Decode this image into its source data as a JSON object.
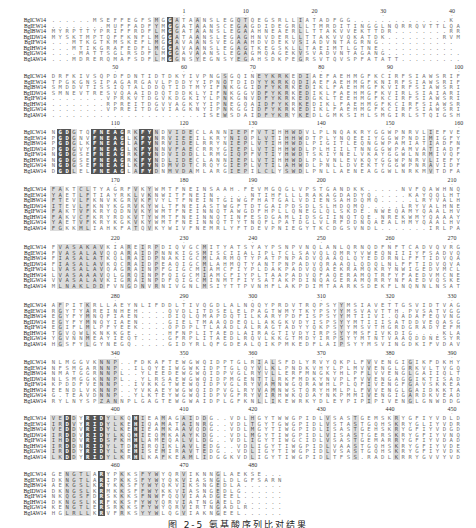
{
  "figure": {
    "caption": "图 2-5 氨基酸序列比对结果",
    "colors": {
      "conserved_bg": "#555555",
      "conserved_fg": "#ffffff",
      "similar_bg": "#dcdcdc",
      "default_fg": "#777777"
    },
    "sequence_names": [
      "BgICW14",
      "BgIEW14",
      "BgIBW14",
      "BgIDW14",
      "BgIFW14",
      "BgIHW14",
      "BgIGW14",
      "BgIAW14"
    ],
    "blocks": [
      {
        "top": 8,
        "ruler": [
          {
            "label": "1",
            "col": 19
          },
          {
            "label": "10",
            "col": 28
          },
          {
            "label": "20",
            "col": 38
          },
          {
            "label": "30",
            "col": 48
          },
          {
            "label": "40",
            "col": 58
          }
        ],
        "rows": [
          "......MSEFFEGFSMGGATAANSLEGQTQEGSRLLIATADFGG..............K",
          "........MUFFADFYMGGATAANSCEGAGDIDEGRLLTMRDITINGGLNQRRQVTTLQADG",
          "MYRPTTYPRIFFRDFLMGGATAANSLEGAAHNEAERLLTTAKVVEKTTDR........RRM",
          "MYSKTMPTQFFKNFLMGGATAANSLEGAGHNVDERLLTTAKVVQKATDK........RVM",
          "...MTKGTKMSKEFLMGGAVAANSVEGAAHDVDEKVSIADVNTAGRNG...........",
          "...MTIKGRAFEDFLMGGAVAANSLEGAGTKEGSKLLTAEIMTLGTNE...........",
          "....MATTSGLRSDFLMGGAVAANSLEGAGMQAGEKVSVADVNTAGANG...........",
          "...MDRERQMAFSDFLMGGNSYEGNSYEGAHSDKPEGRSVTQVSPFATATT........."
        ]
      },
      {
        "top": 64,
        "ruler": [
          {
            "label": "50",
            "col": 9
          },
          {
            "label": "60",
            "col": 19
          },
          {
            "label": "70",
            "col": 29
          },
          {
            "label": "80",
            "col": 39
          },
          {
            "label": "90",
            "col": 49
          },
          {
            "label": "100",
            "col": 59
          }
        ],
        "rows": [
          "DRFKIVSQPDFDNTIDTDKYIVPNGSGQINEYKRKEDIAEFAEHMGFKCIRFSIAWSRIF",
          "TPGKGNSIPAGARGAVLPDDYYIPNQTDIDYYKRKQDIAEFAEHMGFKNIRFSIAWSRIF",
          "SMDDVTISSIQTALDDQTIDTMYIFNKGGIDFYKRKEDIKLFAEHMGFKVIRFSIAWSRIF",
          "SMNEVTRESVQAAIDDQTDDKLYIFNKGGVDFYKRKEDIKLFAEHMGFKVIRLSIAIARIF",
          "........VPRKVTDGVKDGKIYLPNKGNVDFYKRKEDGKLTEEHMGFKCIRFSIAWSRIF",
          "........RPREITDGVVAGKYYIPNEGQAIDFYKRKEDIKLFAEHMGFKCIRFSIAWSRIF",
          "........VPREITDGVIAGKNYIPNKGGIDFYKRKEDIKLFAEHMGFKCIRFSIAWSRIF",
          "......................ISEWSDAIDFYKRYKEDLGMKSIHLSMGIRLSTQIGSHVY"
        ]
      },
      {
        "top": 120,
        "ruler": [
          {
            "label": "110",
            "col": 9
          },
          {
            "label": "120",
            "col": 19
          },
          {
            "label": "130",
            "col": 29
          },
          {
            "label": "140",
            "col": 39
          },
          {
            "label": "150",
            "col": 49
          },
          {
            "label": "160",
            "col": 59
          }
        ],
        "rows": [
          "NGDGTQFNEAGRKFYNDVIDECLANNIEPFVTIHHWDVLPLNQAKRYGGWPNRVLIEFVE",
          "PGDGNVFNEAGLKFYNRVIEEILKRYNIQPLVTIHHWDTPLYNQEEIYGGWPNDIMIGFYQ",
          "PGDGLKFNEAGLAFYNRVIDELRRYNIEPLVTIHHWDLPIGITLEQNGWPAMIATIADFNE",
          "PGDGVYFNEAGLKFYNNVFAECRRYGIEPLVTIHHWDLPLHIILTNNGGWPAMVATIADFTE",
          "NGDGSEFNEAGRKFYNDVIDDLLRMGIQPFVTIYHWDTSKIYNELVKAYGGWLNRMIVQFVE",
          "NGDGSEFNEAGRKFYNDLIDECLANNIEPLVTIHHWDLPLVNLEVKQYGGWPNRVLIEFYN",
          "NGDGSEFNEAGLKFYNDMVDTCRQYGIEPLVTILAHWDLPNLLDVEKTYGGWPNRAVIDFVR",
          "DGDLELFNEAGLAFYDNMVDAMLARGIEPILCLYSWDLPNLLAENEAGGWLNRKMVTDFAEVS"
        ]
      },
      {
        "top": 177,
        "ruler": [
          {
            "label": "170",
            "col": 9
          },
          {
            "label": "180",
            "col": 19
          },
          {
            "label": "190",
            "col": 29
          },
          {
            "label": "200",
            "col": 39
          },
          {
            "label": "210",
            "col": 58
          }
        ],
        "rows": [
          "FAKTCLTYAGRFVKYWMTFNEINSAAH.FEVMGQGLVPSTGANDKK.....NVFQAWHNQ",
          "YAETLFTIAYRKLVKNWITFNEIN.....NTIHFLLLRAKAGDADYQ.....KAYQQLHTQ",
          "FTEVLFKNVKGRVKFVYLTFNEINTGIWGFHATGALVDIENSAHDQMQ.....LRYVALHNQ",
          "ITEVLFKNYKGRVKYWLTFNEIASTWGFTDTGAIPDSDLSLHDQMQ.....LRYVALHNE",
          "FAKTVFKRYQDNVKYWMTFNEINNQTAWGDFHPLLQNEGLQLSKDE.NWEQAMYQAALHVE",
          "FAKVCFKRYRDKVTYWMTFNEINNQTINFESDGAMLIDSGIINQTQE.NREKWMYQAAAYVE",
          "YAETVFKRYKGKVKYWMTFNEINNQTTYTNQFLPATDGLVLRFDDNQAEALHMYQAALHVE",
          "FGKKMLIAHKFATQVKYWIVFNEMRLYFTDEVPNIEGYTKCDGSVNDL.......IRLPANT"
        ]
      },
      {
        "top": 235,
        "ruler": [
          {
            "label": "220",
            "col": 9
          },
          {
            "label": "230",
            "col": 19
          },
          {
            "label": "240",
            "col": 29
          },
          {
            "label": "250",
            "col": 39
          },
          {
            "label": "260",
            "col": 49
          },
          {
            "label": "270",
            "col": 58
          }
        ],
        "rows": [
          "FVASAKAVKIAREIRPDIQVGCMITYATSYAYPSNPVNQLANLQRNQDFNFTCADVQVRG",
          "FVASALAVQQARAIDPNNKIGSMISCIIALIPLTCLSAVQLQMRYVWEQNIIIYFSADVQVRG",
          "FIASALATKQLRAIDPNAKIGCMLARMQTYPATPNPADVQAAQLQYEDDRNLFFTIDVQAR",
          "FIASALAVKQCRAIDPEAQIGCMLAHMQTYANTPNPADVQRAAQLQDQLNLFFTIDVQVAR",
          "LVASALAVQAGRAINPFGIGCMIAMCFIYPLDAKPADVQQAEKRAMQKRYNWIGEDVMCLE",
          "LVASAAAVQLGRQINPFQIGCMIAMCFIYPLTAAPADVQFAQERAMQTRFYFAEDVMCNE",
          "VVASALAVKIGRAINPDFQIGCMINMTFIYSATAKPDINQAGERAMQRRYNFAEDVQSKE",
          "MLNAKLDDFVNGDNVRNIVGNLMSIYTTPVNHFLAKPDIMTAARKSDEKFLNQNNLNSATYVE"
        ]
      },
      {
        "top": 293,
        "ruler": [
          {
            "label": "280",
            "col": 9
          },
          {
            "label": "290",
            "col": 19
          },
          {
            "label": "300",
            "col": 29
          },
          {
            "label": "310",
            "col": 39
          },
          {
            "label": "320",
            "col": 49
          },
          {
            "label": "330",
            "col": 58
          }
        ],
        "rows": [
          "AFPITKRLLAEYNLIFDDLTIVQGDLALNQQYPRDVTRQPSYYMSIAVETTGSVIDTVAG",
          "RGYTYAREINHEH....QVDLITDSELELPAGTWMYTKYPSYYMSVAVTTH.PVSATVGG",
          "EGYFYMNQFIAEN....DIQLQMAPDQTILKARYPDFISPSYYMTIIVI.QADAFEQVNG",
          "EGYFYMNQYIAEN....GIELTMAAQDEQLLAKGKVDYISPSYYMTIIISATDDVEQASG",
          "EGIFLMLPFYEEK....OPDPLTLAADLALRAGTADYYQKPSYYMSVTHGRDGRADYEFM",
          "TGVQWLKNKKGE.....HFNPLITAEDLAIRAGTIVDYIRPSYYMSFIVKDIG....KLAYN",
          "YGVNNMEAYIEQT....GFRPLITAEDLRQVLKKGTMDYIRPSYYMTNTVAAQDDNESYRFV",
          "HGSFYLGYNEGQ.....GIDYRLQFGDEALQIKPMKEDFLAIPSYYMSVINGDKIFVDAVFN"
        ]
      },
      {
        "top": 350,
        "ruler": [
          {
            "label": "340",
            "col": 9
          },
          {
            "label": "350",
            "col": 19
          },
          {
            "label": "360",
            "col": 29
          },
          {
            "label": "370",
            "col": 39
          },
          {
            "label": "380",
            "col": 49
          },
          {
            "label": "390",
            "col": 58
          }
        ],
        "rows": [
          "NLMGGVKNNP..FDKAFTEWGWQIDPTGLRIALSFDLYRVYQKPLFVVENGIGIKFDKHY",
          "NFSMGARNNP..ILQYEIWGWKIDPTGLQYVLKLPNDKVHYLPLMVVENGLGRKVLTVGQ",
          "NMATGGRNNPL..YLEEDEWGWQIDPVGLRYVLLERFMNGKYHLPFLVVENGLGAIIQLTTDQQ",
          "NLSMGGKNNPL..YLRSAEWGWQIDPMGENTTLRKFMDKYNVPLFVVENGAGGIKTISADGR",
          "KPDDFVENNP..IVKKGTWEWQIDPVGLRYVAMNWGQRAWHLPLQFIVENGFGAVSKKEADGS",
          "EENDLVKNNP..YVKAEYWGWQIDPVGLRYVAMNWSTQRYHMLPLFVVENGLGAIDKKTANQ",
          "G.TEAVDNNP..YLKTEYWGWQIDPVGFRYVIRHWKQDAYNKPMMIVENGIGARDKVEADGS",
          "RYLNYSPZANNPLGAGTEWGWAIDPLGFKNLLIKEWRKYDLEYPIPIPIVENGLGNWDDGHM"
        ]
      },
      {
        "top": 406,
        "ruler": [
          {
            "label": "400",
            "col": 9
          },
          {
            "label": "410",
            "col": 19
          },
          {
            "label": "420",
            "col": 29
          },
          {
            "label": "430",
            "col": 39
          },
          {
            "label": "440",
            "col": 49
          },
          {
            "label": "450",
            "col": 58
          }
        ],
        "rows": [
          "VEDDYRIDYLKQHIEAMAGAIDDG..VDLHGYTWWGPIDLVSASTGEMSKRYGFIYVDLDL",
          "IRDVYRIDYLKEHIQAMATAINRG..VDLTGYTGWGPIDLVSTASTGQHSKRYGLIYVDRDQ",
          "VEDDVRIDYLKEHIEAMKAAVQDG..VDLMGYTIWGPIDLISASTGEHSKRYGFIYVDGDE",
          "IRDDVRIDYLKQHIEQMKAAYKDG..VDLMGYTIWGPIDLVISASTGERSKRYGFIYVNQDE",
          "IHDDVRIDSFKHHLAMEQALVLDG..VDLIGYTIWGCIDLVSASTGEMARRYGFIYVDADE",
          "IRDDNRIDYLTDHIRQIKLAVLEDG..VDLIGYTIWGPIDLVAASTGQHSKRYGFIYVDENE",
          "IRDDYRIDYLKEHISEMIRAVTEDG..VDLIGYTIWGPIDLVSASTGQHSKRYGFIYVDKDE",
          "LKDDYRIDYLKRHLKAFKEAMLIDGGKVDLIGYTIWGPIDLTFSS.RADLKRRYGVVYVDRSN"
        ]
      },
      {
        "top": 462,
        "ruler": [
          {
            "label": "460",
            "col": 9
          },
          {
            "label": "470",
            "col": 19
          },
          {
            "label": "480",
            "col": 29
          }
        ],
        "rows": [
          "GENGTLARYPKKSFYWYQRVIKNNGLAEKSE...",
          "DKNGTLARIPKKSFYWYQKVIASNGLDLGFSARN",
          "AEKGSLKRYKKSFYWYQKVIKSNGEDLA......",
          "DKNGSLKRMKKSFFWYKKVIASNGEDLG......",
          "NKQGSFDRSKKKSFNWFQQVIAADGEEL......",
          "DKNGSLKRFKKSFYWYQRVIATNGAELD......",
          "KENGTLERSRKKSFYWYQRVIRTNGADLR.....",
          "HGLRLLKRVFRKSYYWLQGVIAKNGEEL......"
        ]
      }
    ]
  }
}
